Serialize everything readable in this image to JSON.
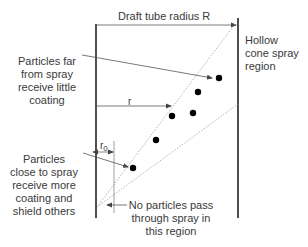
{
  "diagram": {
    "title_label": "Draft tube radius R",
    "spray_region_label": [
      "Hollow",
      "cone spray",
      "region"
    ],
    "far_particles_label": [
      "Particles far",
      "from spray",
      "receive little",
      "coating"
    ],
    "close_particles_label": [
      "Particles",
      "close to spray",
      "receive more",
      "coating and",
      "shield others"
    ],
    "no_particles_label": [
      "No particles pass",
      "through spray in",
      "this region"
    ],
    "r_label": "r",
    "r0_label": "r",
    "r0_subscript": "0",
    "colors": {
      "wall": "#222222",
      "arrow": "#555555",
      "dashed": "#aaaaaa",
      "particle": "#000000",
      "text": "#3a3a3a"
    },
    "particles": [
      {
        "x": 219,
        "y": 78
      },
      {
        "x": 198,
        "y": 92
      },
      {
        "x": 193,
        "y": 113
      },
      {
        "x": 172,
        "y": 116
      },
      {
        "x": 156,
        "y": 140
      },
      {
        "x": 133,
        "y": 168
      }
    ]
  }
}
